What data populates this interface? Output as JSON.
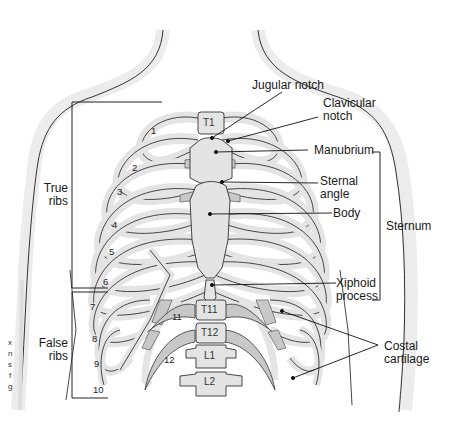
{
  "figure": {
    "colors": {
      "bone_fill": "#e4e4e4",
      "cartilage_fill": "#c8c8c8",
      "body_outline_fill": "#ececec",
      "line": "#222222",
      "background": "#ffffff"
    }
  },
  "labels": {
    "jugular_notch": "Jugular notch",
    "clavicular_notch_1": "Clavicular",
    "clavicular_notch_2": "notch",
    "manubrium": "Manubrium",
    "sternal_angle_1": "Sternal",
    "sternal_angle_2": "angle",
    "body": "Body",
    "sternum": "Sternum",
    "xiphoid_1": "Xiphoid",
    "xiphoid_2": "process",
    "costal_1": "Costal",
    "costal_2": "cartilage",
    "true_ribs_1": "True",
    "true_ribs_2": "ribs",
    "false_ribs_1": "False",
    "false_ribs_2": "ribs"
  },
  "rib_numbers": [
    "1",
    "2",
    "3",
    "4",
    "5",
    "6",
    "7",
    "8",
    "9",
    "10",
    "11",
    "12"
  ],
  "vertebrae": [
    "T1",
    "T11",
    "T12",
    "L1",
    "L2"
  ],
  "left_edge_fragments": [
    "x",
    "n",
    "s",
    "f",
    "g"
  ]
}
